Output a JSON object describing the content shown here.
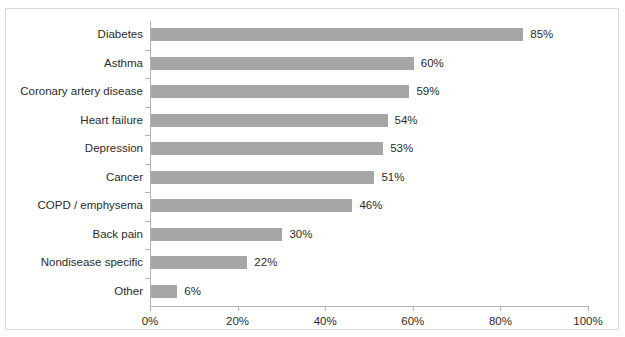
{
  "chart_data": {
    "type": "bar",
    "orientation": "horizontal",
    "title": "",
    "subtitle": "",
    "xlabel": "",
    "ylabel": "",
    "xlim": [
      0,
      100
    ],
    "xticks": [
      "0%",
      "20%",
      "40%",
      "60%",
      "80%",
      "100%"
    ],
    "xtick_values": [
      0,
      20,
      40,
      60,
      80,
      100
    ],
    "grid": false,
    "legend": null,
    "categories": [
      "Diabetes",
      "Asthma",
      "Coronary artery disease",
      "Heart failure",
      "Depression",
      "Cancer",
      "COPD / emphysema",
      "Back pain",
      "Nondisease specific",
      "Other"
    ],
    "values": [
      85,
      60,
      59,
      54,
      53,
      51,
      46,
      30,
      22,
      6
    ],
    "value_labels": [
      "85%",
      "60%",
      "59%",
      "54%",
      "53%",
      "51%",
      "46%",
      "30%",
      "22%",
      "6%"
    ],
    "bar_color": "#a6a6a6",
    "axis_color": "#b3b3b3",
    "text_color": "#2b2b2b",
    "border_color": "#d9d9d9",
    "background": "#ffffff"
  }
}
